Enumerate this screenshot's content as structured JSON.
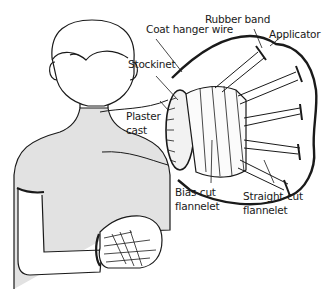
{
  "figure": {
    "labels": {
      "coat_hanger_wire": "Coat hanger wire",
      "rubber_band": "Rubber band",
      "applicator": "Applicator",
      "stockinet": "Stockinet",
      "plaster_cast_line1": "Plaster",
      "plaster_cast_line2": "cast",
      "bias_cut_line1": "Bias-cut",
      "bias_cut_line2": "flannelet",
      "straight_cut_line1": "Straight-cut",
      "straight_cut_line2": "flannelet"
    },
    "colors": {
      "ink": "#1a1a1a",
      "skin_shade": "#e2e2e2",
      "background": "#ffffff"
    }
  }
}
